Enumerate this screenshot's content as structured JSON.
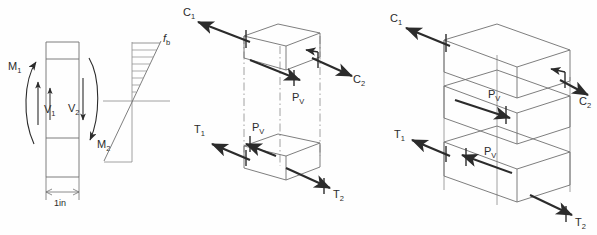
{
  "figure": {
    "background_color": "#fefefe",
    "ink_color": "#2b2b2b",
    "light_ink_color": "#8a8a8a"
  },
  "panel_left": {
    "name": "beam-element-and-stress-distribution",
    "element_labels": {
      "moment_left": "M",
      "moment_left_sub": "1",
      "shear_left": "V",
      "shear_left_sub": "1",
      "shear_right": "V",
      "shear_right_sub": "2",
      "moment_right": "M",
      "moment_right_sub": "2"
    },
    "dimension": {
      "label": "1in"
    },
    "stress_label": {
      "symbol": "f",
      "subscript": "b"
    }
  },
  "panel_middle": {
    "name": "single-block-force-couple",
    "labels": {
      "compression_1": "C",
      "compression_1_sub": "1",
      "compression_2": "C",
      "compression_2_sub": "2",
      "tension_1": "T",
      "tension_1_sub": "1",
      "tension_2": "T",
      "tension_2_sub": "2",
      "shear_top": "P",
      "shear_top_sub": "V",
      "shear_bottom": "P",
      "shear_bottom_sub": "V"
    }
  },
  "panel_right": {
    "name": "stacked-slab-force-couple",
    "labels": {
      "compression_1": "C",
      "compression_1_sub": "1",
      "compression_2": "C",
      "compression_2_sub": "2",
      "tension_1": "T",
      "tension_1_sub": "1",
      "tension_2": "T",
      "tension_2_sub": "2",
      "shear_upper": "P",
      "shear_upper_sub": "V",
      "shear_lower": "P",
      "shear_lower_sub": "V"
    }
  }
}
